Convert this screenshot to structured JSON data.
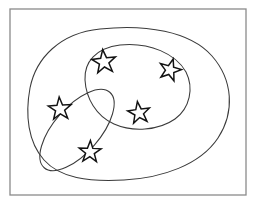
{
  "diagram": {
    "type": "venn-set-diagram",
    "canvas": {
      "width": 256,
      "height": 204,
      "background": "#ffffff"
    },
    "colors": {
      "universe_border": "#8a8a8a",
      "region_outline": "#3a3a3a",
      "star_outline": "#121212",
      "star_fill": "#ffffff",
      "background": "#ffffff"
    },
    "universe": {
      "name": "universe-rectangle",
      "shape": "rectangle",
      "x": 10,
      "y": 9,
      "width": 236,
      "height": 186
    },
    "regions": [
      {
        "id": "outer-blob",
        "label": "",
        "shape": "closed-blob",
        "contains": [
          "inner-triangle-blob",
          "tilted-oval-blob"
        ],
        "star_count_total": 5,
        "path": "M 100 29 C 145 24 190 31 212 56 C 233 80 235 112 218 138 C 200 165 162 178 124 180 C 88 182 60 178 44 160 C 28 142 25 115 30 88 C 36 58 60 33 100 29 Z"
      },
      {
        "id": "inner-triangle-blob",
        "label": "",
        "shape": "rounded-triangle",
        "parent": "outer-blob",
        "star_count": 3,
        "path": "M 120 45 C 150 42 176 54 186 72 C 194 88 190 108 175 119 C 158 131 132 132 114 124 C 96 116 86 98 85 80 C 84 62 96 48 120 45 Z"
      },
      {
        "id": "tilted-oval-blob",
        "label": "",
        "shape": "tilted-ellipse",
        "parent": "outer-blob",
        "star_count": 2,
        "rotation_deg": -49,
        "center_x": 77,
        "center_y": 130,
        "radius_x": 50,
        "radius_y": 23
      }
    ],
    "stars": [
      {
        "id": "star-1",
        "name": "star-inner-top-left",
        "region": "inner-triangle-blob",
        "cx": 104,
        "cy": 62,
        "radius": 12.5,
        "rotation_deg": -6
      },
      {
        "id": "star-2",
        "name": "star-inner-top-right",
        "region": "inner-triangle-blob",
        "cx": 170,
        "cy": 70,
        "radius": 11.5,
        "rotation_deg": 16
      },
      {
        "id": "star-3",
        "name": "star-inner-bottom",
        "region": "inner-triangle-blob",
        "cx": 139,
        "cy": 113,
        "radius": 11.5,
        "rotation_deg": -8
      },
      {
        "id": "star-4",
        "name": "star-oval-upper",
        "region": "tilted-oval-blob",
        "cx": 60,
        "cy": 109,
        "radius": 12.0,
        "rotation_deg": -4
      },
      {
        "id": "star-5",
        "name": "star-oval-lower",
        "region": "tilted-oval-blob",
        "cx": 90,
        "cy": 152,
        "radius": 11.5,
        "rotation_deg": 2
      }
    ]
  }
}
